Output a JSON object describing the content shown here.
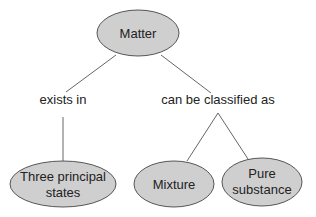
{
  "diagram": {
    "type": "concept-map",
    "root": {
      "label": "Matter"
    },
    "links": [
      {
        "label": "exists in"
      },
      {
        "label": "can be classified as"
      }
    ],
    "nodes": {
      "three_states": {
        "line1": "Three principal",
        "line2": "states"
      },
      "mixture": {
        "label": "Mixture"
      },
      "pure": {
        "line1": "Pure",
        "line2": "substance"
      }
    },
    "colors": {
      "node_fill": "#cfcfcf",
      "node_stroke": "#555555",
      "line": "#666666"
    }
  }
}
